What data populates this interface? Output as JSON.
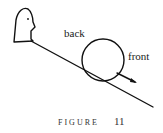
{
  "diagram": {
    "labels": {
      "back": "back",
      "front": "front"
    },
    "caption": {
      "word": "FIGURE",
      "number": "11"
    },
    "elements": [
      "head-figure",
      "inclined-slope",
      "rolling-ball",
      "direction-arrow"
    ]
  }
}
